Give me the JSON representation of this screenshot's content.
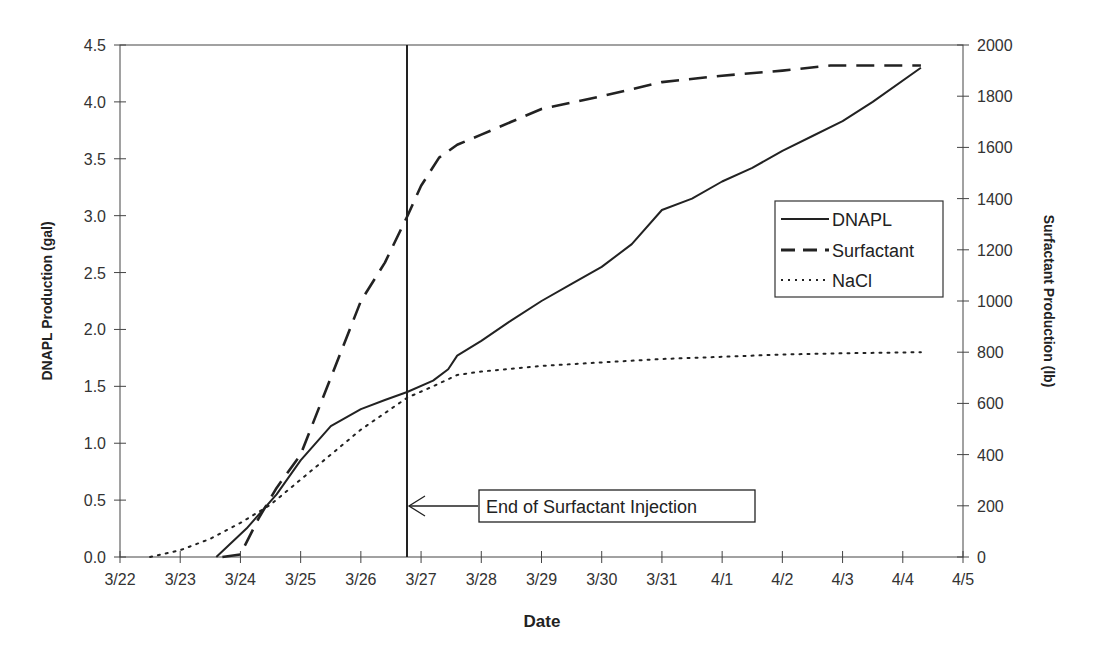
{
  "chart_data": {
    "type": "line",
    "title": "",
    "xlabel": "Date",
    "ylabel": "DNAPL Production (gal)",
    "y2label": "Surfactant Production (lb)",
    "x_ticks": [
      "3/22",
      "3/23",
      "3/24",
      "3/25",
      "3/26",
      "3/27",
      "3/28",
      "3/29",
      "3/30",
      "3/31",
      "4/1",
      "4/2",
      "4/3",
      "4/4",
      "4/5"
    ],
    "ylim": [
      0,
      4.5
    ],
    "y_ticks": [
      "0.0",
      "0.5",
      "1.0",
      "1.5",
      "2.0",
      "2.5",
      "3.0",
      "3.5",
      "4.0",
      "4.5"
    ],
    "y2lim": [
      0,
      2000
    ],
    "y2_ticks": [
      "0",
      "200",
      "400",
      "600",
      "800",
      "1000",
      "1200",
      "1400",
      "1600",
      "1800",
      "2000"
    ],
    "grid": false,
    "legend_position": "right-middle inside plot",
    "x_unit": "days since 3/22",
    "series": [
      {
        "name": "DNAPL",
        "axis": "left",
        "style": "solid",
        "x": [
          1.6,
          2.1,
          2.6,
          3.0,
          3.5,
          4.0,
          4.4,
          4.77,
          5.2,
          5.45,
          5.6,
          6.0,
          6.5,
          7.0,
          7.5,
          8.0,
          8.5,
          9.0,
          9.5,
          10.0,
          10.5,
          11.0,
          11.5,
          12.0,
          12.5,
          13.3
        ],
        "values": [
          0.0,
          0.25,
          0.55,
          0.85,
          1.15,
          1.3,
          1.38,
          1.45,
          1.55,
          1.65,
          1.77,
          1.9,
          2.08,
          2.25,
          2.4,
          2.55,
          2.75,
          3.05,
          3.15,
          3.3,
          3.42,
          3.57,
          3.7,
          3.83,
          4.0,
          4.3
        ]
      },
      {
        "name": "Surfactant",
        "axis": "right",
        "style": "dashed",
        "x": [
          1.7,
          2.0,
          2.3,
          2.6,
          3.0,
          3.5,
          4.0,
          4.4,
          4.77,
          5.0,
          5.3,
          5.6,
          6.0,
          6.5,
          7.0,
          8.0,
          9.0,
          10.0,
          11.0,
          11.8,
          13.3
        ],
        "values": [
          0,
          10,
          150,
          270,
          400,
          700,
          1000,
          1150,
          1330,
          1450,
          1560,
          1610,
          1650,
          1700,
          1750,
          1800,
          1855,
          1880,
          1900,
          1920,
          1920
        ]
      },
      {
        "name": "NaCl",
        "axis": "left",
        "style": "dotted",
        "x": [
          0.5,
          1.0,
          1.5,
          2.0,
          2.5,
          3.0,
          3.5,
          4.0,
          4.77,
          5.2,
          5.6,
          6.0,
          7.0,
          8.0,
          9.0,
          10.0,
          11.0,
          12.0,
          13.3
        ],
        "values": [
          0.0,
          0.06,
          0.16,
          0.3,
          0.46,
          0.68,
          0.9,
          1.12,
          1.4,
          1.5,
          1.6,
          1.63,
          1.68,
          1.71,
          1.74,
          1.76,
          1.78,
          1.79,
          1.8
        ]
      }
    ],
    "annotations": [
      {
        "text": "End of Surfactant Injection",
        "x": 4.77,
        "type": "vertical-line-with-arrow-label",
        "label_y": 0.45
      }
    ]
  },
  "legend": {
    "items": [
      {
        "label": "DNAPL",
        "style": "solid"
      },
      {
        "label": "Surfactant",
        "style": "dashed"
      },
      {
        "label": "NaCl",
        "style": "dotted"
      }
    ]
  },
  "annotation": {
    "label": "End of Surfactant Injection"
  },
  "axes": {
    "x_title": "Date",
    "y_left_title": "DNAPL Production (gal)",
    "y_right_title": "Surfactant Production (lb)"
  },
  "colors": {
    "line": "#222222",
    "axis": "#333333",
    "background": "#ffffff"
  }
}
